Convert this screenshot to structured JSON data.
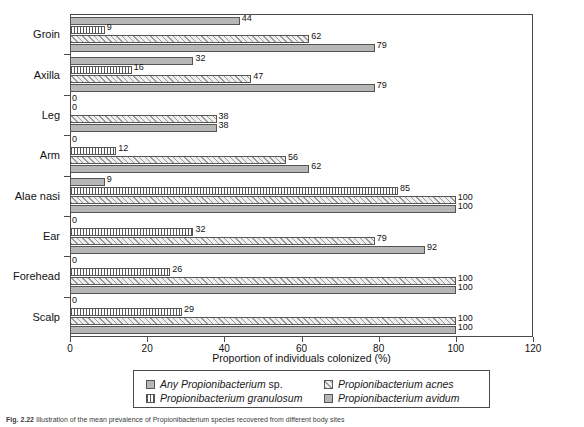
{
  "chart_data": {
    "type": "bar",
    "orientation": "horizontal",
    "title": "",
    "xlabel": "Proportion of individuals colonized (%)",
    "ylabel": "",
    "xlim": [
      0,
      120
    ],
    "xticks": [
      0,
      20,
      40,
      60,
      80,
      100,
      120
    ],
    "grid": false,
    "legend_position": "bottom",
    "categories": [
      "Groin",
      "Axilla",
      "Leg",
      "Arm",
      "Alae nasi",
      "Ear",
      "Forehead",
      "Scalp"
    ],
    "series": [
      {
        "name": "Any Propionibacterium sp.",
        "pattern": "solid",
        "color": "#b7b7b7",
        "values": [
          79,
          79,
          38,
          62,
          100,
          92,
          100,
          100
        ]
      },
      {
        "name": "Propionibacterium acnes",
        "pattern": "diagonal-hatch",
        "color": "#efefef",
        "values": [
          62,
          47,
          38,
          56,
          100,
          79,
          100,
          100
        ]
      },
      {
        "name": "Propionibacterium granulosum",
        "pattern": "vertical-stripe",
        "color": "#ffffff",
        "values": [
          9,
          16,
          0,
          12,
          85,
          32,
          26,
          29
        ]
      },
      {
        "name": "Propionibacterium avidum",
        "pattern": "solid",
        "color": "#b7b7b7",
        "values": [
          44,
          32,
          0,
          0,
          9,
          0,
          0,
          0
        ]
      }
    ]
  },
  "legend": {
    "items": [
      {
        "label_italic": "Any Propionibacterium",
        "label_roman": " sp.",
        "swatch": "solid"
      },
      {
        "label_italic": "Propionibacterium acnes",
        "label_roman": "",
        "swatch": "diagonal-hatch"
      },
      {
        "label_italic": "Propionibacterium granulosum",
        "label_roman": "",
        "swatch": "vertical-stripe"
      },
      {
        "label_italic": "Propionibacterium avidum",
        "label_roman": "",
        "swatch": "solid"
      }
    ]
  },
  "axis": {
    "x_title": "Proportion of individuals colonized (%)",
    "x_tick_labels": [
      "0",
      "20",
      "40",
      "60",
      "80",
      "100",
      "120"
    ]
  },
  "caption": {
    "figure_number": "Fig. 2.22",
    "text": " Illustration of the mean prevalence of Propionibacterium species recovered from different body sites"
  }
}
